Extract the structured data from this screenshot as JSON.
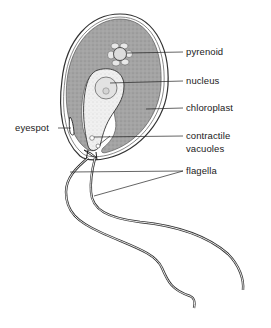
{
  "diagram": {
    "labels": {
      "pyrenoid": "pyrenoid",
      "nucleus": "nucleus",
      "chloroplast": "chloroplast",
      "eyespot": "eyespot",
      "contractile_vacuoles_line1": "contractile",
      "contractile_vacuoles_line2": "vacuoles",
      "flagella": "flagella"
    },
    "colors": {
      "chloroplast_fill": "#a8a8a8",
      "cytoplasm_fill": "#eeeeee",
      "outline": "#333333",
      "background": "#ffffff"
    }
  }
}
